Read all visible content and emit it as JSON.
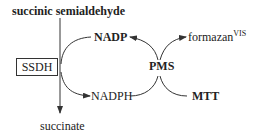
{
  "diagram": {
    "substrate": "succinic semialdehyde",
    "enzyme": "SSDH",
    "product": "succinate",
    "cofactor_oxidized": "NADP",
    "cofactor_reduced": "NADPH",
    "mediator": "PMS",
    "dye": "MTT",
    "dye_product": "formazan",
    "dye_product_superscript": "VIS"
  }
}
